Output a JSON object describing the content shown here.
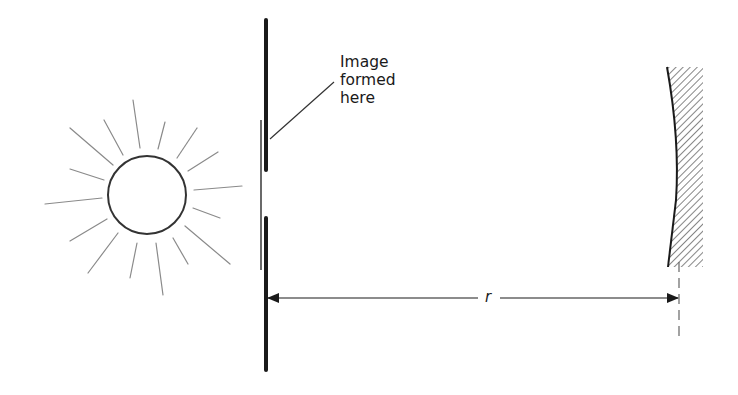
{
  "diagram": {
    "type": "optics-schematic",
    "labels": {
      "image_formed": [
        "Image",
        "formed",
        "here"
      ],
      "distance": "r"
    },
    "elements": {
      "sun": {
        "cx": 147,
        "cy": 195,
        "r": 39,
        "ray_count": 16
      },
      "screen_upper": {
        "x": 266,
        "y1": 20,
        "y2": 170
      },
      "screen_lower": {
        "x": 266,
        "y1": 218,
        "y2": 370
      },
      "image_plane": {
        "x": 261,
        "y1": 120,
        "y2": 270
      },
      "mirror": {
        "x_top": 667,
        "y_top": 67,
        "x_bottom": 668,
        "y_bottom": 267,
        "hatched": true
      },
      "dimension_line": {
        "y": 298,
        "x1": 266,
        "x2": 679,
        "label": "r"
      }
    },
    "colors": {
      "stroke": "#1a1a1a",
      "ray": "#8a8a8a",
      "background": "#ffffff"
    }
  }
}
